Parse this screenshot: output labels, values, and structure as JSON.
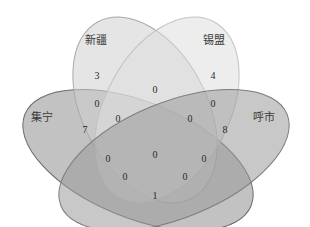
{
  "diagram": {
    "type": "venn-4-ellipse",
    "sets": [
      {
        "name": "集宁",
        "color": "#9c9c9c",
        "label_x": 42,
        "label_y": 121
      },
      {
        "name": "新疆",
        "color": "#d8d8d8",
        "label_x": 96,
        "label_y": 44
      },
      {
        "name": "锡盟",
        "color": "#e2e2e2",
        "label_x": 214,
        "label_y": 44
      },
      {
        "name": "呼市",
        "color": "#a8a8a8",
        "label_x": 264,
        "label_y": 121
      }
    ],
    "regions": [
      {
        "sets": [
          "新疆"
        ],
        "value": "3",
        "x": 97,
        "y": 79
      },
      {
        "sets": [
          "锡盟"
        ],
        "value": "4",
        "x": 213,
        "y": 79
      },
      {
        "sets": [
          "新疆",
          "锡盟"
        ],
        "value": "0",
        "x": 155,
        "y": 93
      },
      {
        "sets": [
          "集宁",
          "新疆"
        ],
        "value": "0",
        "x": 97,
        "y": 107
      },
      {
        "sets": [
          "锡盟",
          "呼市"
        ],
        "value": "0",
        "x": 213,
        "y": 107
      },
      {
        "sets": [
          "集宁"
        ],
        "value": "7",
        "x": 85,
        "y": 133
      },
      {
        "sets": [
          "集宁",
          "新疆",
          "锡盟"
        ],
        "value": "0",
        "x": 118,
        "y": 122
      },
      {
        "sets": [
          "新疆",
          "锡盟",
          "呼市"
        ],
        "value": "0",
        "x": 190,
        "y": 122
      },
      {
        "sets": [
          "呼市"
        ],
        "value": "8",
        "x": 225,
        "y": 133
      },
      {
        "sets": [
          "集宁",
          "新疆",
          "锡盟",
          "呼市"
        ],
        "value": "0",
        "x": 155,
        "y": 158
      },
      {
        "sets": [
          "集宁",
          "锡盟"
        ],
        "value": "0",
        "x": 108,
        "y": 162
      },
      {
        "sets": [
          "新疆",
          "呼市"
        ],
        "value": "0",
        "x": 204,
        "y": 162
      },
      {
        "sets": [
          "集宁",
          "锡盟",
          "呼市"
        ],
        "value": "0",
        "x": 125,
        "y": 180
      },
      {
        "sets": [
          "集宁",
          "新疆",
          "呼市"
        ],
        "value": "0",
        "x": 185,
        "y": 180
      },
      {
        "sets": [
          "集宁",
          "呼市"
        ],
        "value": "1",
        "x": 155,
        "y": 199
      }
    ]
  }
}
